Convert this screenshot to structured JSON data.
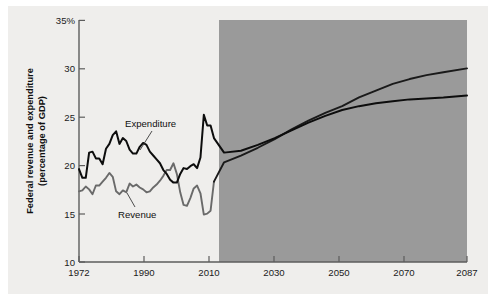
{
  "chart_data": {
    "type": "line",
    "title": "",
    "subtitle": "",
    "xlabel": "",
    "ylabel": "Federal revenue and expenditure (percentage of GDP)",
    "ylabel_line1": "Federal revenue and expenditure",
    "ylabel_line2": "(percentage of GDP)",
    "xlim": [
      1972,
      2087
    ],
    "ylim": [
      10,
      35
    ],
    "xticks": [
      1972,
      1990,
      2010,
      2030,
      2050,
      2070,
      2087
    ],
    "xtick_labels": [
      "1972",
      "1990",
      "2010",
      "2030",
      "2050",
      "2070",
      "2087"
    ],
    "yticks": [
      10,
      15,
      20,
      25,
      30,
      35
    ],
    "ytick_labels": [
      "10",
      "15",
      "20",
      "25",
      "30",
      "35%"
    ],
    "grid": false,
    "legend_position": "inline-annotations",
    "annotations": [
      {
        "name": "expenditure-label",
        "text": "Expenditure",
        "x": 1990,
        "y": 24.6
      },
      {
        "name": "revenue-label",
        "text": "Revenue",
        "x": 1987,
        "y": 15.6
      }
    ],
    "shaded_region": {
      "name": "projection-band",
      "label": "",
      "x_start": 2012,
      "x_end": 2087,
      "color": "#9a9a9a"
    },
    "colors": {
      "expenditure": "#0d0d0d",
      "revenue_historical": "#6a6a6a",
      "revenue_projected": "#1a1a1a",
      "background": "#efeeec",
      "shaded": "#9a9a9a",
      "axis": "#5d5d5d"
    },
    "series": [
      {
        "name": "Expenditure",
        "color": "#0d0d0d",
        "x": [
          1972,
          1973,
          1974,
          1975,
          1976,
          1977,
          1978,
          1979,
          1980,
          1981,
          1982,
          1983,
          1984,
          1985,
          1986,
          1987,
          1988,
          1989,
          1990,
          1991,
          1992,
          1993,
          1994,
          1995,
          1996,
          1997,
          1998,
          1999,
          2000,
          2001,
          2002,
          2003,
          2004,
          2005,
          2006,
          2007,
          2008,
          2009,
          2010,
          2011,
          2012,
          2015,
          2020,
          2025,
          2030,
          2035,
          2040,
          2045,
          2050,
          2055,
          2060,
          2065,
          2070,
          2075,
          2080,
          2087
        ],
        "values": [
          19.6,
          18.7,
          18.7,
          21.3,
          21.4,
          20.7,
          20.7,
          20.1,
          21.7,
          22.2,
          23.1,
          23.5,
          22.2,
          22.8,
          22.5,
          21.6,
          21.2,
          21.2,
          21.9,
          22.3,
          22.1,
          21.4,
          21.0,
          20.6,
          20.2,
          19.5,
          19.1,
          18.5,
          18.2,
          18.2,
          19.1,
          19.7,
          19.6,
          19.9,
          20.1,
          19.7,
          20.8,
          25.2,
          24.1,
          24.1,
          22.8,
          21.3,
          21.5,
          22.1,
          22.8,
          23.6,
          24.4,
          25.1,
          25.7,
          26.1,
          26.4,
          26.6,
          26.8,
          26.9,
          27.0,
          27.2
        ]
      },
      {
        "name": "Revenue",
        "color": "#6a6a6a",
        "x": [
          1972,
          1973,
          1974,
          1975,
          1976,
          1977,
          1978,
          1979,
          1980,
          1981,
          1982,
          1983,
          1984,
          1985,
          1986,
          1987,
          1988,
          1989,
          1990,
          1991,
          1992,
          1993,
          1994,
          1995,
          1996,
          1997,
          1998,
          1999,
          2000,
          2001,
          2002,
          2003,
          2004,
          2005,
          2006,
          2007,
          2008,
          2009,
          2010,
          2011,
          2012,
          2015,
          2020,
          2025,
          2030,
          2035,
          2040,
          2045,
          2050,
          2055,
          2060,
          2065,
          2070,
          2075,
          2080,
          2087
        ],
        "values": [
          17.3,
          17.4,
          17.8,
          17.5,
          17.0,
          17.9,
          17.9,
          18.3,
          18.7,
          19.2,
          18.8,
          17.3,
          17.0,
          17.4,
          17.2,
          18.1,
          17.8,
          18.0,
          17.7,
          17.5,
          17.2,
          17.3,
          17.7,
          18.0,
          18.4,
          18.9,
          19.5,
          19.5,
          20.2,
          19.1,
          17.2,
          15.9,
          15.8,
          16.6,
          17.6,
          17.9,
          17.1,
          14.9,
          15.0,
          15.3,
          18.3,
          20.3,
          21.0,
          21.8,
          22.7,
          23.7,
          24.6,
          25.4,
          26.1,
          27.0,
          27.7,
          28.4,
          28.9,
          29.3,
          29.6,
          30.0
        ]
      }
    ]
  }
}
